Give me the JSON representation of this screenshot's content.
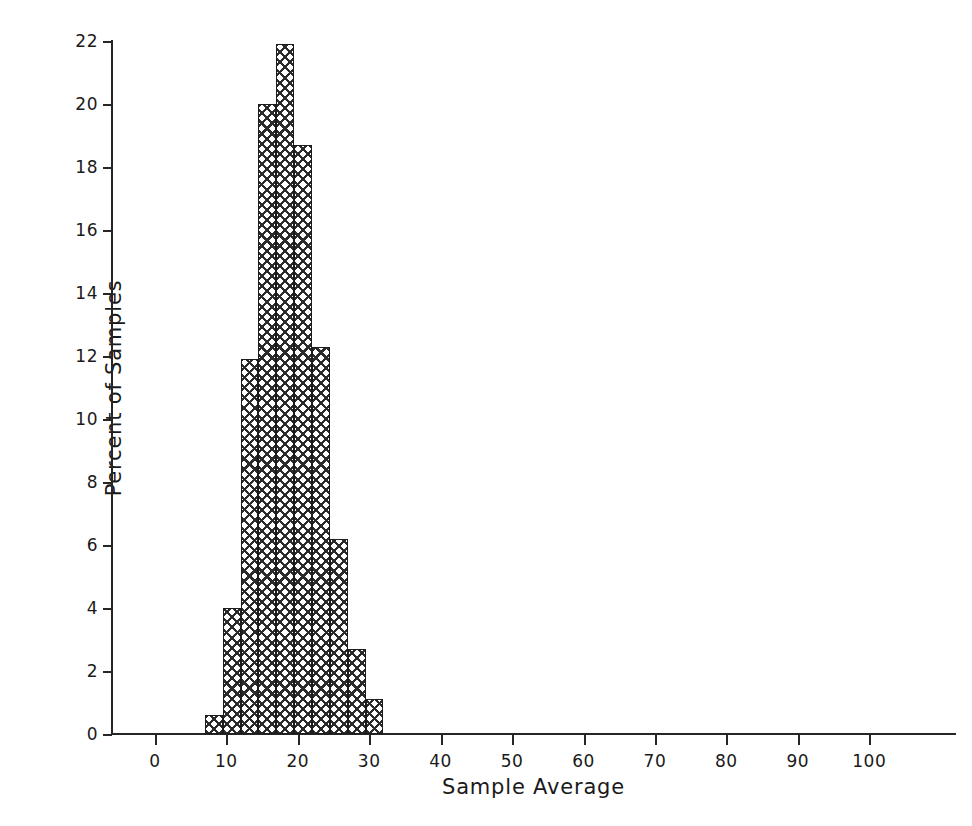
{
  "chart_data": {
    "type": "bar",
    "title": "",
    "subtitle": "",
    "xlabel": "Sample Average",
    "ylabel": "Percent of Samples",
    "xlim": [
      -6,
      112
    ],
    "ylim": [
      0,
      22
    ],
    "xticks": [
      0,
      10,
      20,
      30,
      40,
      50,
      60,
      70,
      80,
      90,
      100
    ],
    "xtick_labels": [
      "0",
      "10",
      "20",
      "30",
      "40",
      "50",
      "60",
      "70",
      "80",
      "90",
      "100"
    ],
    "yticks": [
      0,
      2,
      4,
      6,
      8,
      10,
      12,
      14,
      16,
      18,
      20,
      22
    ],
    "ytick_labels": [
      "0",
      "2",
      "4",
      "6",
      "8",
      "10",
      "12",
      "14",
      "16",
      "18",
      "20",
      "22"
    ],
    "grid": false,
    "legend": false,
    "legend_position": "none",
    "bin_width": 2.5,
    "bin_edges": [
      7.0,
      9.5,
      12.0,
      14.5,
      17.0,
      19.5,
      22.0,
      24.5,
      27.0,
      29.5,
      32.0
    ],
    "categories": [
      "7.0-9.5",
      "9.5-12.0",
      "12.0-14.5",
      "14.5-17.0",
      "17.0-19.5",
      "19.5-22.0",
      "22.0-24.5",
      "24.5-27.0",
      "27.0-29.5",
      "29.5-32.0"
    ],
    "bin_centers": [
      8.25,
      10.75,
      13.25,
      15.75,
      18.25,
      20.75,
      23.25,
      25.75,
      28.25,
      30.75
    ],
    "values": [
      0.6,
      4.0,
      11.9,
      20.0,
      21.9,
      18.7,
      12.3,
      6.2,
      2.7,
      1.1
    ],
    "bar_fill": "crosshatch",
    "bar_edge_color": "#1c1c1c",
    "bar_fill_color": "#2b2b2b",
    "background_color": "#ffffff",
    "axis_color": "#262626"
  }
}
